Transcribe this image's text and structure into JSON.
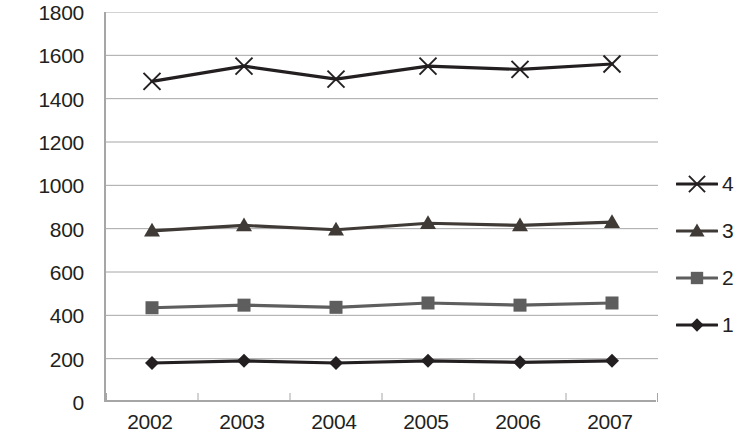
{
  "chart_data": {
    "type": "line",
    "title": "",
    "xlabel": "",
    "ylabel": "",
    "categories": [
      "2002",
      "2003",
      "2004",
      "2005",
      "2006",
      "2007"
    ],
    "ylim": [
      0,
      1800
    ],
    "ytick_step": 200,
    "yticks": [
      "0",
      "200",
      "400",
      "600",
      "800",
      "1000",
      "1200",
      "1400",
      "1600",
      "1800"
    ],
    "grid": "horizontal",
    "legend_position": "right",
    "series": [
      {
        "name": "4",
        "marker": "x-cross",
        "color": "#231f20",
        "values": [
          1480,
          1550,
          1490,
          1550,
          1535,
          1560
        ]
      },
      {
        "name": "3",
        "marker": "triangle",
        "color": "#3f3a36",
        "values": [
          790,
          815,
          795,
          825,
          815,
          830
        ]
      },
      {
        "name": "2",
        "marker": "square",
        "color": "#5e5e5e",
        "values": [
          435,
          447,
          437,
          457,
          447,
          457
        ]
      },
      {
        "name": "1",
        "marker": "diamond",
        "color": "#231f20",
        "values": [
          180,
          190,
          180,
          190,
          183,
          190
        ]
      }
    ],
    "legend_order": [
      "4",
      "3",
      "2",
      "1"
    ]
  },
  "colors": {
    "axis": "#a6a6a6",
    "gridline": "#a6a6a6",
    "text": "#231f20",
    "background": "#ffffff"
  }
}
